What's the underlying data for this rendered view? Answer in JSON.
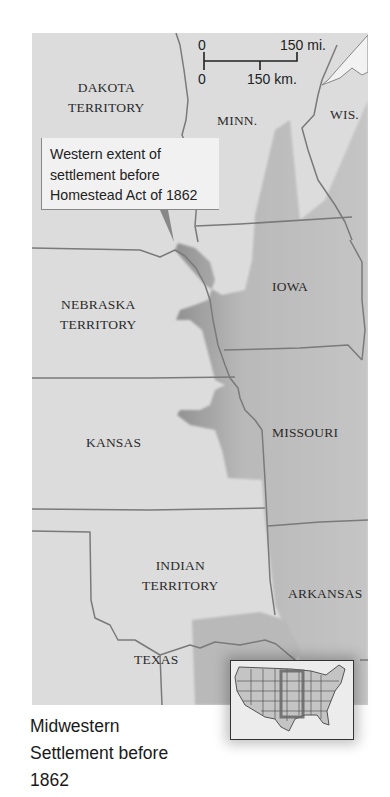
{
  "map": {
    "title_lines": [
      "Midwestern",
      "Settlement before",
      "1862"
    ],
    "callout_lines": [
      "Western extent of",
      "settlement before",
      "Homestead Act of 1862"
    ],
    "scale": {
      "mi_zero": "0",
      "mi_label": "150 mi.",
      "km_zero": "0",
      "km_label": "150 km."
    },
    "labels": {
      "dakota_1": "DAKOTA",
      "dakota_2": "TERRITORY",
      "minn": "MINN.",
      "wis": "WIS.",
      "iowa": "IOWA",
      "nebraska_1": "NEBRASKA",
      "nebraska_2": "TERRITORY",
      "kansas": "KANSAS",
      "missouri": "MISSOURI",
      "indian_1": "INDIAN",
      "indian_2": "TERRITORY",
      "arkansas": "ARKANSAS",
      "texas": "TEXAS"
    },
    "colors": {
      "land": "#dcdcdc",
      "settled": "#b5b5b5",
      "border": "#777777",
      "lake": "#f2f2f2"
    }
  }
}
